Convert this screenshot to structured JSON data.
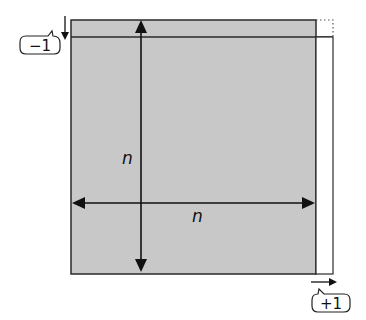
{
  "diagram": {
    "square_fill": "#c8c8c8",
    "stroke": "#1a1a1a",
    "labels": {
      "vertical_side": "n",
      "horizontal_side": "n",
      "minus_callout": "−1",
      "plus_callout": "+1"
    }
  }
}
